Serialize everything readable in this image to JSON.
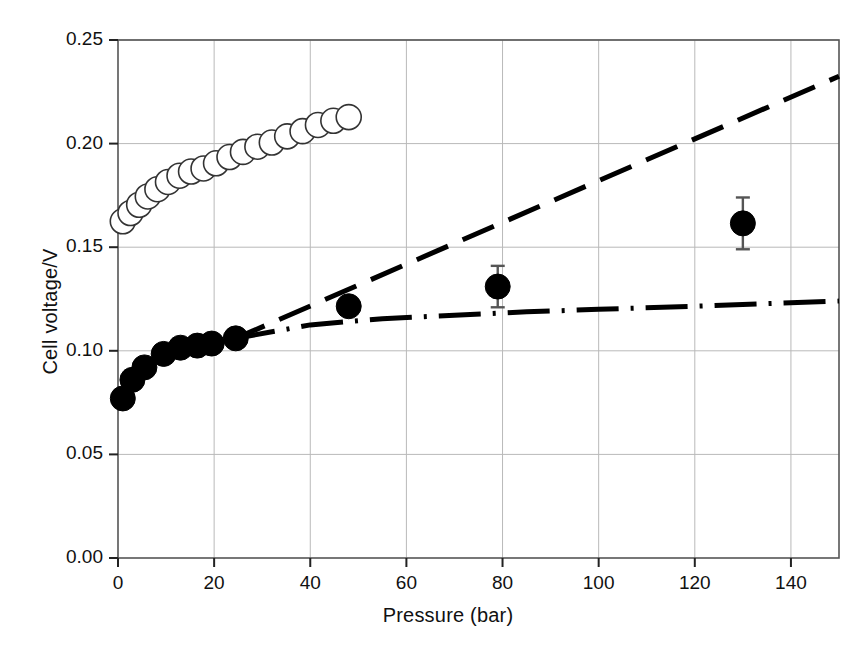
{
  "chart_data": {
    "type": "scatter",
    "title": "",
    "xlabel": "Pressure (bar)",
    "ylabel": "Cell voltage/V",
    "xlim": [
      0,
      150
    ],
    "ylim": [
      0.0,
      0.25
    ],
    "xticks": [
      0,
      20,
      40,
      60,
      80,
      100,
      120,
      140
    ],
    "yticks": [
      0.0,
      0.05,
      0.1,
      0.15,
      0.2,
      0.25
    ],
    "xtick_labels": [
      "0",
      "20",
      "40",
      "60",
      "80",
      "100",
      "120",
      "140"
    ],
    "ytick_labels": [
      "0.00",
      "0.05",
      "0.10",
      "0.15",
      "0.20",
      "0.25"
    ],
    "grid": true,
    "legend": "none",
    "series": [
      {
        "name": "filled-circles",
        "marker": "filled circle",
        "color": "#000000",
        "points": [
          {
            "x": 1.0,
            "y": 0.077
          },
          {
            "x": 3.0,
            "y": 0.086
          },
          {
            "x": 5.5,
            "y": 0.092
          },
          {
            "x": 9.5,
            "y": 0.0985
          },
          {
            "x": 13.0,
            "y": 0.1015
          },
          {
            "x": 16.5,
            "y": 0.1025
          },
          {
            "x": 19.5,
            "y": 0.1035
          },
          {
            "x": 24.5,
            "y": 0.106
          },
          {
            "x": 48.0,
            "y": 0.1215
          },
          {
            "x": 79.0,
            "y": 0.131
          },
          {
            "x": 130.0,
            "y": 0.1615
          }
        ],
        "errorbars": [
          {
            "x": 79.0,
            "y": 0.131,
            "err": 0.01
          },
          {
            "x": 130.0,
            "y": 0.1615,
            "err": 0.0125
          }
        ]
      },
      {
        "name": "open-circles",
        "marker": "open circle",
        "color": "#000000",
        "points": [
          {
            "x": 1.0,
            "y": 0.1625
          },
          {
            "x": 2.6,
            "y": 0.1665
          },
          {
            "x": 4.4,
            "y": 0.1705
          },
          {
            "x": 6.2,
            "y": 0.1745
          },
          {
            "x": 8.2,
            "y": 0.178
          },
          {
            "x": 10.4,
            "y": 0.1815
          },
          {
            "x": 12.8,
            "y": 0.1845
          },
          {
            "x": 15.2,
            "y": 0.1865
          },
          {
            "x": 17.8,
            "y": 0.188
          },
          {
            "x": 20.4,
            "y": 0.1905
          },
          {
            "x": 23.2,
            "y": 0.1935
          },
          {
            "x": 26.0,
            "y": 0.196
          },
          {
            "x": 29.0,
            "y": 0.1985
          },
          {
            "x": 32.0,
            "y": 0.2005
          },
          {
            "x": 35.2,
            "y": 0.2035
          },
          {
            "x": 38.4,
            "y": 0.206
          },
          {
            "x": 41.6,
            "y": 0.209
          },
          {
            "x": 44.8,
            "y": 0.211
          },
          {
            "x": 48.0,
            "y": 0.2128
          }
        ]
      },
      {
        "name": "dashed-model-line",
        "style": "dashed",
        "color": "#000000",
        "points": [
          {
            "x": 24.0,
            "y": 0.1055
          },
          {
            "x": 150.0,
            "y": 0.2325
          }
        ]
      },
      {
        "name": "dash-dot-model-line",
        "style": "dash-dot",
        "color": "#000000",
        "points": [
          {
            "x": 24.0,
            "y": 0.1058
          },
          {
            "x": 40.0,
            "y": 0.1125
          },
          {
            "x": 55.0,
            "y": 0.1155
          },
          {
            "x": 70.0,
            "y": 0.1172
          },
          {
            "x": 85.0,
            "y": 0.1188
          },
          {
            "x": 100.0,
            "y": 0.12
          },
          {
            "x": 120.0,
            "y": 0.1215
          },
          {
            "x": 150.0,
            "y": 0.124
          }
        ]
      }
    ]
  },
  "axis": {
    "x_title": "Pressure (bar)",
    "y_title": "Cell voltage/V"
  }
}
